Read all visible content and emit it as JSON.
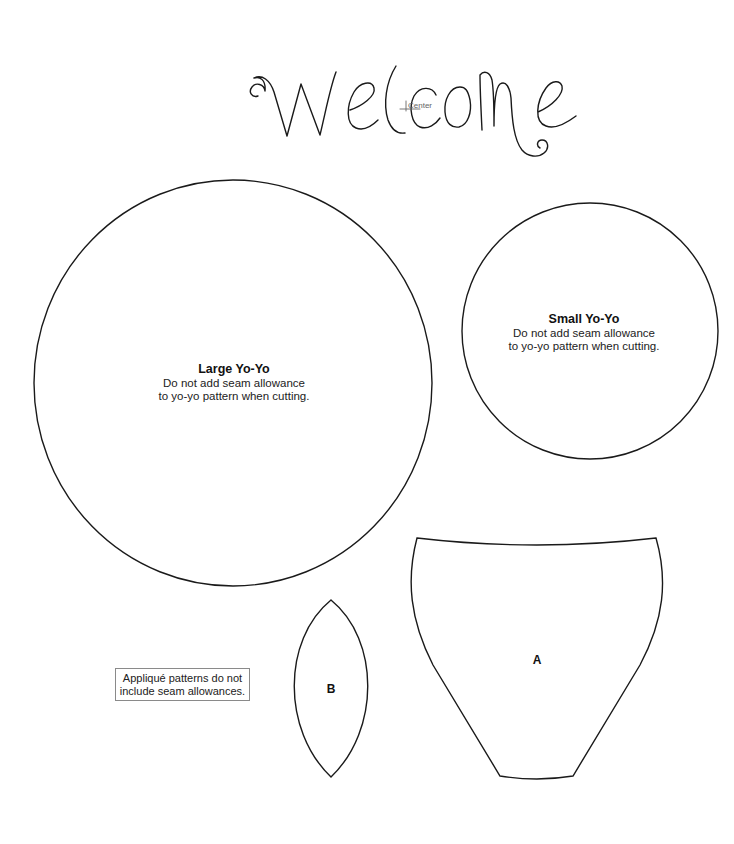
{
  "heading": {
    "text": "Welcome",
    "center_mark_label": "Center"
  },
  "large_yoyo": {
    "title": "Large Yo-Yo",
    "line1": "Do not add seam allowance",
    "line2": "to yo-yo pattern when cutting."
  },
  "small_yoyo": {
    "title": "Small Yo-Yo",
    "line1": "Do not add seam allowance",
    "line2": "to yo-yo pattern when cutting."
  },
  "pieces": {
    "a": {
      "label": "A",
      "shape": "vase"
    },
    "b": {
      "label": "B",
      "shape": "leaf"
    }
  },
  "note": {
    "line1": "Appliqué patterns do not",
    "line2": "include seam allowances."
  },
  "colors": {
    "stroke": "#1a1a1a",
    "background": "#ffffff",
    "note_border": "#8a8a8a",
    "center_mark": "#666666"
  }
}
